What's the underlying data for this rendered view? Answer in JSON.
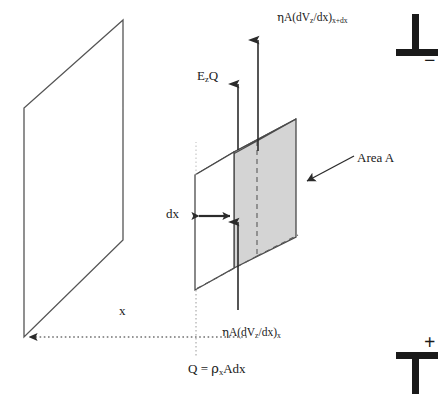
{
  "figure": {
    "domain": "scientific-diagram",
    "background_color": "#ffffff",
    "stroke_color": "#3a3a3a",
    "text_color": "#1a1a1a",
    "face_fill_shaded": "#d4d4d4",
    "face_fill_plain": "#ffffff",
    "width": 440,
    "height": 399
  },
  "labels": {
    "flux_top": {
      "eta": "η",
      "prefix": "A(dV",
      "sub_z": "z",
      "mid": "/dx)",
      "sub_xdx": "x+dx",
      "plain": "ηA(dVz/dx)x+dx"
    },
    "flux_bottom": {
      "eta": "η",
      "prefix": "A(dV",
      "sub_z": "z",
      "mid": "/dx)",
      "sub_x": "x",
      "plain": "ηA(dVz/dx)x"
    },
    "electric_force": {
      "main": "E",
      "sub": "z",
      "tail": "Q",
      "plain": "EzQ"
    },
    "area": "Area A",
    "thickness": "dx",
    "distance": "x",
    "charge": {
      "lead": "Q = ",
      "rho": "ρ",
      "sub": "x",
      "tail": "Adx",
      "plain": "Q = ρxAdx"
    },
    "electrode_top_sign": "−",
    "electrode_bottom_sign": "+"
  },
  "geometry": {
    "plane": {
      "name": "electrode-plane",
      "points": "123,20 24,108 24,337 123,240"
    },
    "box": {
      "name": "fluid-element-box",
      "front_face": "195,175 234,152 234,268 195,290",
      "shaded_face": "234,152 296,119 296,237 234,268",
      "top_face": "195,175 234,152 296,119 257,141",
      "hidden_edges": [
        "257,141 257,256",
        "257,256 296,237",
        "257,256 195,290"
      ]
    },
    "arrows": {
      "flux_top_arrow": {
        "x": 258,
        "y1": 151,
        "y2": 36,
        "head": "up"
      },
      "electric_arrow": {
        "x": 238,
        "y1": 148,
        "y2": 80,
        "head": "up"
      },
      "flux_bottom_arrow": {
        "x": 238,
        "y1": 222,
        "y2": 314,
        "head": "down"
      },
      "dx_arrow": {
        "x1": 196,
        "x2": 233,
        "y": 216,
        "head": "both"
      },
      "distance_arrow": {
        "x1": 247,
        "x2": 26,
        "y": 337,
        "head": "left",
        "style": "dotted"
      },
      "area_pointer": {
        "x1": 352,
        "x2": 304,
        "y1": 157,
        "y2": 182,
        "head": "end"
      },
      "charge_guide": {
        "x": 196,
        "y1": 290,
        "y2": 356,
        "style": "dotted"
      }
    },
    "electrodes": {
      "top": {
        "name": "top-electrode",
        "orientation": "inverted-tee",
        "bar": "396,56 438,56",
        "stem": "416,16 416,56"
      },
      "bottom": {
        "name": "bottom-electrode",
        "orientation": "tee",
        "bar": "396,355 438,355",
        "stem": "416,355 416,394"
      }
    }
  }
}
